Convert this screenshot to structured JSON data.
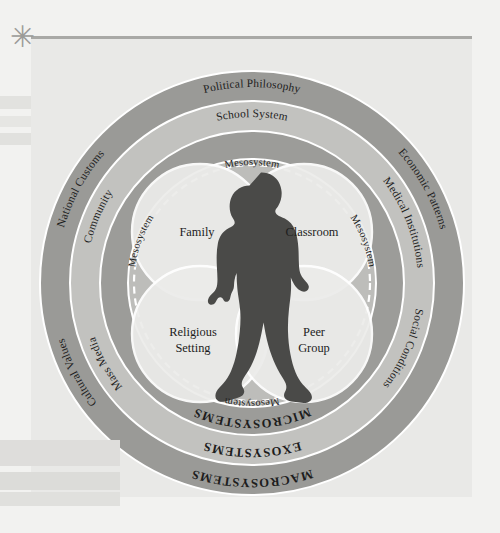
{
  "diagram": {
    "colors": {
      "page_background": "#f2f2f0",
      "panel_background": "#e9e9e7",
      "ring_dark": "#9a9a97",
      "ring_mid": "#c0c0bd",
      "ring_inner": "#a8a8a5",
      "circle_fill": "#ececea",
      "silhouette": "#4a4a48",
      "text": "#1d1d1d",
      "ring_outline": "#ffffff"
    },
    "center_figure": {
      "name": "child-silhouette",
      "description": "Child standing with hands on hips"
    },
    "microsystems": {
      "band_label": "MICROSYSTEMS",
      "circles": [
        {
          "id": "family",
          "label": "Family",
          "position": "top-left"
        },
        {
          "id": "classroom",
          "label": "Classroom",
          "position": "top-right"
        },
        {
          "id": "religious-setting",
          "label": "Religious\nSetting",
          "line1": "Religious",
          "line2": "Setting",
          "position": "bottom-left"
        },
        {
          "id": "peer-group",
          "label": "Peer\nGroup",
          "line1": "Peer",
          "line2": "Group",
          "position": "bottom-right"
        }
      ]
    },
    "mesosystem": {
      "band_label": "Mesosystem",
      "instances": [
        {
          "id": "mesosystem-top",
          "label": "Mesosystem",
          "position": "top"
        },
        {
          "id": "mesosystem-right",
          "label": "Mesosystem",
          "position": "right"
        },
        {
          "id": "mesosystem-bottom",
          "label": "Mesosystem",
          "position": "bottom"
        },
        {
          "id": "mesosystem-left",
          "label": "Mesosystem",
          "position": "left"
        }
      ]
    },
    "exosystems": {
      "band_label": "EXOSYSTEMS",
      "items": [
        {
          "id": "school-system",
          "label": "School System",
          "position": "top"
        },
        {
          "id": "medical-institutions",
          "label": "Medical Institutions",
          "position": "right"
        },
        {
          "id": "social-conditions",
          "label": "Social Conditions",
          "position": "bottom-right"
        },
        {
          "id": "mass-media",
          "label": "Mass Media",
          "position": "bottom-left"
        },
        {
          "id": "community",
          "label": "Community",
          "position": "left"
        }
      ]
    },
    "macrosystems": {
      "band_label": "MACROSYSTEMS",
      "items": [
        {
          "id": "political-philosophy",
          "label": "Political Philosophy",
          "position": "top"
        },
        {
          "id": "economic-patterns",
          "label": "Economic Patterns",
          "position": "right"
        },
        {
          "id": "national-customs",
          "label": "National Customs",
          "position": "left"
        },
        {
          "id": "cultural-values",
          "label": "Cultural Values",
          "position": "bottom-left"
        }
      ]
    },
    "marks": {
      "asterisk": "✳"
    }
  }
}
